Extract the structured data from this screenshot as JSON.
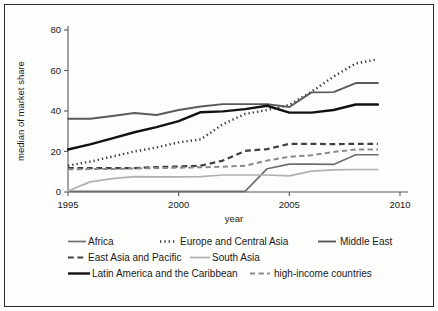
{
  "chart_data": {
    "type": "line",
    "title": "",
    "xlabel": "year",
    "ylabel": "median of market share",
    "xlim": [
      1995,
      2010
    ],
    "ylim": [
      0,
      80
    ],
    "xticks": [
      1995,
      2000,
      2005,
      2010
    ],
    "yticks": [
      0,
      20,
      40,
      60,
      80
    ],
    "grid": false,
    "legend_position": "bottom",
    "x": [
      1995,
      1996,
      1997,
      1998,
      1999,
      2000,
      2001,
      2002,
      2003,
      2004,
      2005,
      2006,
      2007,
      2008,
      2009
    ],
    "series": [
      {
        "name": "Africa",
        "color": "#6e6e6e",
        "style": "solid",
        "width": 1.7,
        "values": [
          0.3,
          0.3,
          0.3,
          0.3,
          0.3,
          0.3,
          0.3,
          0.3,
          0.3,
          11.5,
          13.8,
          13.8,
          13.6,
          18.4,
          18.4
        ]
      },
      {
        "name": "Europe and Central Asia",
        "color": "#3a3a3a",
        "style": "dotted",
        "width": 2.4,
        "values": [
          13.0,
          15.0,
          17.5,
          20.0,
          22.0,
          24.5,
          26.0,
          33.5,
          38.5,
          40.5,
          43.0,
          49.5,
          57.0,
          63.5,
          65.5
        ]
      },
      {
        "name": "Middle East",
        "color": "#5a5a5a",
        "style": "solid",
        "width": 1.9,
        "values": [
          36.2,
          36.2,
          37.5,
          39.0,
          38.0,
          40.5,
          42.2,
          43.4,
          43.4,
          43.4,
          42.0,
          49.2,
          49.3,
          53.8,
          53.8
        ]
      },
      {
        "name": "East Asia and Pacific",
        "color": "#3f3f3f",
        "style": "dashed",
        "width": 2.2,
        "values": [
          11.8,
          11.8,
          11.8,
          11.8,
          12.3,
          12.6,
          13.0,
          15.5,
          20.3,
          21.2,
          23.8,
          23.8,
          23.6,
          23.8,
          23.8
        ]
      },
      {
        "name": "South Asia",
        "color": "#b0b0b0",
        "style": "solid",
        "width": 1.7,
        "values": [
          0.5,
          5.0,
          6.6,
          7.6,
          7.5,
          7.5,
          7.6,
          8.4,
          8.4,
          8.4,
          8.0,
          10.3,
          10.9,
          11.1,
          11.1
        ]
      },
      {
        "name": "Latin America and the Caribbean",
        "color": "#111111",
        "style": "solid",
        "width": 2.4,
        "values": [
          21.0,
          23.5,
          26.5,
          29.5,
          32.0,
          35.0,
          39.4,
          39.8,
          40.9,
          42.6,
          39.2,
          39.2,
          40.5,
          43.2,
          43.2
        ]
      },
      {
        "name": "high-income countries",
        "color": "#8a8a8a",
        "style": "dashed",
        "width": 2.0,
        "values": [
          11.2,
          11.3,
          11.4,
          11.6,
          11.8,
          12.0,
          12.2,
          12.5,
          13.0,
          15.5,
          17.4,
          18.2,
          19.8,
          21.0,
          21.0
        ]
      }
    ]
  },
  "axes": {
    "y_title": "median of market share",
    "x_title": "year",
    "y_tick_labels": [
      "0",
      "20",
      "40",
      "60",
      "80"
    ],
    "x_tick_labels": [
      "1995",
      "2000",
      "2005",
      "2010"
    ]
  },
  "legend": {
    "rows": [
      [
        {
          "label": "Africa",
          "key": "Africa"
        },
        {
          "label": "Europe and Central Asia",
          "key": "Europe and Central Asia"
        },
        {
          "label": "Middle East",
          "key": "Middle East"
        }
      ],
      [
        {
          "label": "East Asia and Pacific",
          "key": "East Asia and Pacific"
        },
        {
          "label": "South Asia",
          "key": "South Asia"
        }
      ],
      [
        {
          "label": "Latin America and the Caribbean",
          "key": "Latin America and the Caribbean"
        },
        {
          "label": "high-income countries",
          "key": "high-income countries"
        }
      ]
    ]
  }
}
